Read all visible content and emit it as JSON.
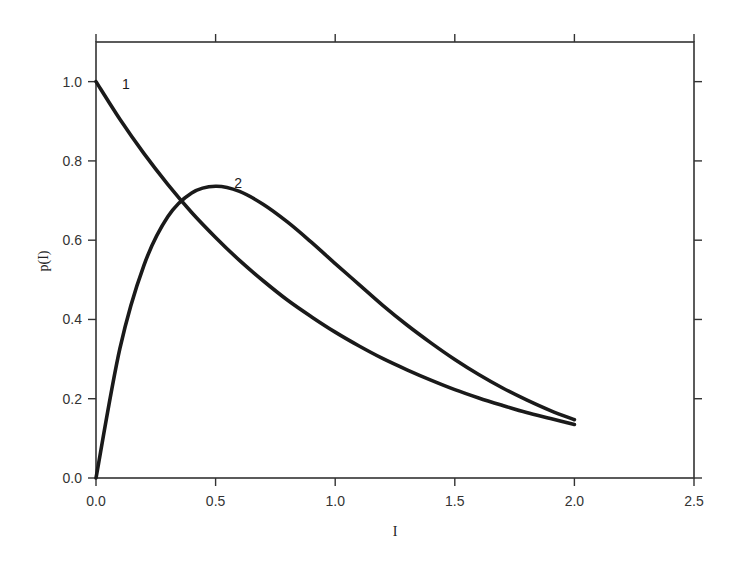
{
  "chart_data": {
    "type": "line",
    "title": "",
    "xlabel": "I",
    "ylabel": "p(I)",
    "xlim": [
      0,
      2.5
    ],
    "ylim": [
      0,
      1.1
    ],
    "grid": false,
    "legend": "none (inline curve labels)",
    "x_ticks": [
      0.0,
      0.5,
      1.0,
      1.5,
      2.0,
      2.5
    ],
    "x_tick_labels": [
      "0.0",
      "0.5",
      "1.0",
      "1.5",
      "2.0",
      "2.5"
    ],
    "y_ticks": [
      0.0,
      0.2,
      0.4,
      0.6,
      0.8,
      1.0
    ],
    "y_tick_labels": [
      "0.0",
      "0.2",
      "0.4",
      "0.6",
      "0.8",
      "1.0"
    ],
    "x": [
      0.0,
      0.1,
      0.2,
      0.3,
      0.4,
      0.5,
      0.6,
      0.7,
      0.8,
      0.9,
      1.0,
      1.1,
      1.2,
      1.3,
      1.4,
      1.5,
      1.6,
      1.7,
      1.8,
      1.9,
      2.0
    ],
    "series": [
      {
        "name": "1",
        "label": "1",
        "values": [
          1.0,
          0.905,
          0.819,
          0.741,
          0.67,
          0.607,
          0.549,
          0.497,
          0.449,
          0.407,
          0.368,
          0.333,
          0.301,
          0.273,
          0.247,
          0.223,
          0.202,
          0.183,
          0.165,
          0.15,
          0.135
        ],
        "color": "#1a1a1a"
      },
      {
        "name": "2",
        "label": "2",
        "values": [
          0.0,
          0.327,
          0.536,
          0.659,
          0.719,
          0.736,
          0.723,
          0.69,
          0.646,
          0.595,
          0.541,
          0.488,
          0.435,
          0.386,
          0.341,
          0.299,
          0.261,
          0.227,
          0.197,
          0.17,
          0.147
        ],
        "color": "#1a1a1a"
      }
    ],
    "annotations": [
      {
        "text": "1",
        "x": 0.1,
        "y": 0.99
      },
      {
        "text": "2",
        "x": 0.57,
        "y": 0.74
      }
    ]
  }
}
